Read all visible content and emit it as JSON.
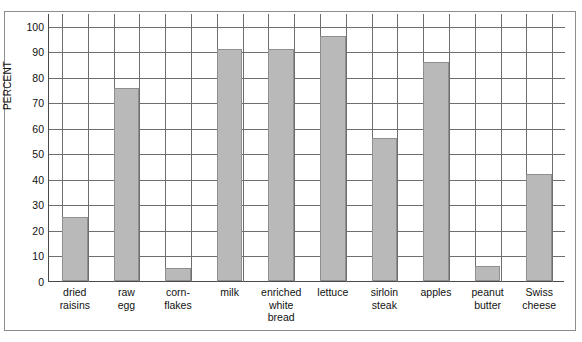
{
  "chart_data": {
    "type": "bar",
    "title": "",
    "xlabel": "",
    "ylabel": "PERCENT",
    "ylim": [
      0,
      105
    ],
    "ytick_labels": [
      "0",
      "10",
      "20",
      "30",
      "40",
      "50",
      "60",
      "70",
      "80",
      "90",
      "100"
    ],
    "yticks": [
      0,
      10,
      20,
      30,
      40,
      50,
      60,
      70,
      80,
      90,
      100
    ],
    "grid": true,
    "legend": "none",
    "bar_color": "#b9b9b9",
    "bar_edge_color": "#8f8f8f",
    "categories": [
      "dried\nraisins",
      "raw\negg",
      "corn-\nflakes",
      "milk",
      "enriched\nwhite\nbread",
      "lettuce",
      "sirloin\nsteak",
      "apples",
      "peanut\nbutter",
      "Swiss\ncheese"
    ],
    "category_lines": [
      [
        "dried",
        "raisins"
      ],
      [
        "raw",
        "egg"
      ],
      [
        "corn-",
        "flakes"
      ],
      [
        "milk"
      ],
      [
        "enriched",
        "white",
        "bread"
      ],
      [
        "lettuce"
      ],
      [
        "sirloin",
        "steak"
      ],
      [
        "apples"
      ],
      [
        "peanut",
        "butter"
      ],
      [
        "Swiss",
        "cheese"
      ]
    ],
    "values": [
      25,
      75.5,
      5,
      91,
      91,
      96,
      56,
      86,
      6,
      42
    ]
  }
}
